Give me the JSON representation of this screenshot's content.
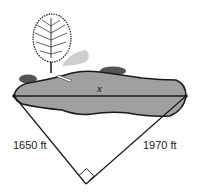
{
  "figure": {
    "lake_width_label": "x",
    "left_leg_label": "1650 ft",
    "right_leg_label": "1970 ft",
    "right_angle": true
  },
  "colors": {
    "lake_fill": "#a0a0a0",
    "outline": "#1a1a1a",
    "shadow": "#c8c8c8",
    "background": "#ffffff"
  }
}
